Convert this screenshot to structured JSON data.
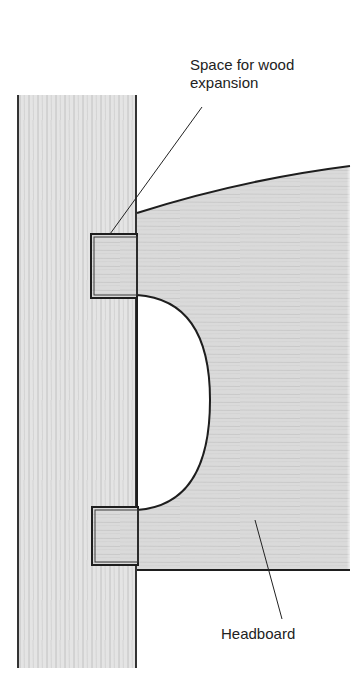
{
  "diagram": {
    "labels": {
      "expansion_line1": "Space for wood",
      "expansion_line2": "expansion",
      "headboard": "Headboard"
    },
    "parts": {
      "post": "bed-post",
      "headboard": "headboard",
      "upper_tenon": "upper-tenon",
      "lower_tenon": "lower-tenon",
      "cutout": "semi-circular-cutout"
    },
    "colors": {
      "outline": "#1e1e1e",
      "wood_fill": "#dcdcdc",
      "tenon_fill": "#cfcfcf",
      "background": "#ffffff"
    }
  }
}
